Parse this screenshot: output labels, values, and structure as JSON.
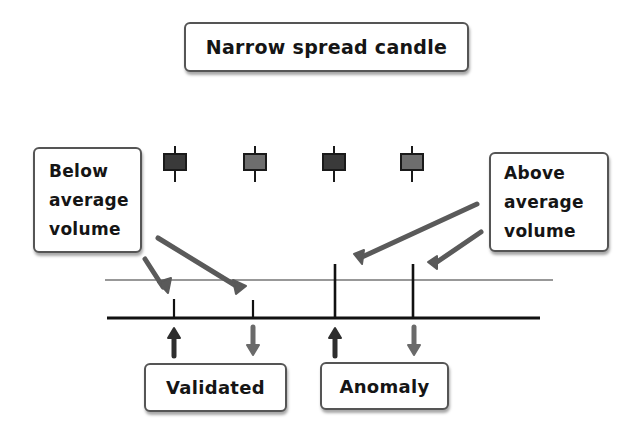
{
  "title": "Narrow spread candle",
  "callouts": {
    "below": {
      "lines": [
        "Below",
        "average",
        "volume"
      ]
    },
    "above": {
      "lines": [
        "Above",
        "average",
        "volume"
      ]
    }
  },
  "outcomes": {
    "validated": "Validated",
    "anomaly": "Anomaly"
  },
  "candles": [
    {
      "id": "candle-1",
      "shade": "dark",
      "volume": "below-average",
      "arrow": "up"
    },
    {
      "id": "candle-2",
      "shade": "light",
      "volume": "below-average",
      "arrow": "down"
    },
    {
      "id": "candle-3",
      "shade": "dark",
      "volume": "above-average",
      "arrow": "up"
    },
    {
      "id": "candle-4",
      "shade": "light",
      "volume": "above-average",
      "arrow": "down"
    }
  ],
  "colors": {
    "candle_dark": "#3a3a3a",
    "candle_light": "#6e6e6e",
    "candle_border": "#1a1a1a",
    "arrow_dark": "#2e2e2e",
    "arrow_light": "#6a6a6a",
    "pointer": "#5a5a5a",
    "line": "#111111"
  }
}
